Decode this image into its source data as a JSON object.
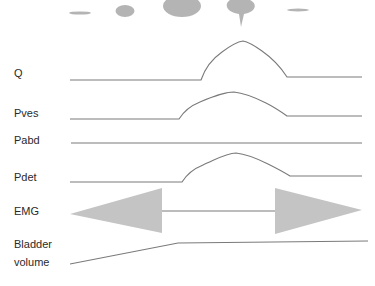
{
  "diagram": {
    "type": "urodynamic-voiding-trace",
    "colors": {
      "trace": "#7a7a7a",
      "fill": "#b4b4b4",
      "text": "#2a2a2a"
    },
    "flow_stream_stages": [
      {
        "shape": "thin-ellipse"
      },
      {
        "shape": "small-drop"
      },
      {
        "shape": "large-drop"
      },
      {
        "shape": "pear-drop-with-tail"
      },
      {
        "shape": "thin-ellipse"
      }
    ],
    "traces": [
      {
        "id": "q",
        "label": "Q",
        "description": "flow rate rises, peaks, returns to baseline"
      },
      {
        "id": "pves",
        "label": "Pves",
        "description": "vesical pressure rises during voiding"
      },
      {
        "id": "pabd",
        "label": "Pabd",
        "description": "abdominal pressure flat"
      },
      {
        "id": "pdet",
        "label": "Pdet",
        "description": "detrusor pressure rises during voiding"
      },
      {
        "id": "emg",
        "label": "EMG",
        "description": "high activity during filling, silent during voiding, high after"
      },
      {
        "id": "volume",
        "label_line1": "Bladder",
        "label_line2": "volume",
        "description": "volume rises during filling, then plateau"
      }
    ]
  }
}
